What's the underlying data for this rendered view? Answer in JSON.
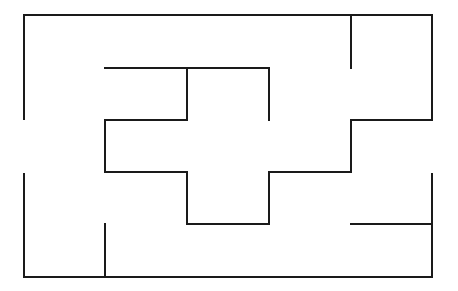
{
  "diagram": {
    "type": "maze",
    "width": 458,
    "height": 291,
    "stroke_color": "#1a1a1a",
    "stroke_width": 2,
    "segments": [
      {
        "name": "outer-top-wall",
        "x1": 24,
        "y1": 15,
        "x2": 432,
        "y2": 15
      },
      {
        "name": "outer-left-wall-upper",
        "x1": 24,
        "y1": 15,
        "x2": 24,
        "y2": 119
      },
      {
        "name": "outer-left-wall-lower",
        "x1": 24,
        "y1": 174,
        "x2": 24,
        "y2": 277
      },
      {
        "name": "outer-bottom-wall",
        "x1": 24,
        "y1": 277,
        "x2": 432,
        "y2": 277
      },
      {
        "name": "outer-right-wall-upper",
        "x1": 432,
        "y1": 15,
        "x2": 432,
        "y2": 120
      },
      {
        "name": "outer-right-wall-lower",
        "x1": 432,
        "y1": 174,
        "x2": 432,
        "y2": 277
      },
      {
        "name": "top-right-spur",
        "x1": 351,
        "y1": 15,
        "x2": 351,
        "y2": 68
      },
      {
        "name": "inner-top-horizontal",
        "x1": 105,
        "y1": 68,
        "x2": 269,
        "y2": 68
      },
      {
        "name": "inner-mid-vertical-left",
        "x1": 187,
        "y1": 68,
        "x2": 187,
        "y2": 120
      },
      {
        "name": "inner-right-vertical",
        "x1": 269,
        "y1": 68,
        "x2": 269,
        "y2": 120
      },
      {
        "name": "left-step-horizontal",
        "x1": 105,
        "y1": 120,
        "x2": 187,
        "y2": 120
      },
      {
        "name": "left-step-vertical",
        "x1": 105,
        "y1": 120,
        "x2": 105,
        "y2": 172
      },
      {
        "name": "left-lower-horizontal",
        "x1": 105,
        "y1": 172,
        "x2": 187,
        "y2": 172
      },
      {
        "name": "center-lower-vertical-left",
        "x1": 187,
        "y1": 172,
        "x2": 187,
        "y2": 224
      },
      {
        "name": "center-bottom-horizontal",
        "x1": 187,
        "y1": 224,
        "x2": 269,
        "y2": 224
      },
      {
        "name": "center-lower-vertical-right",
        "x1": 269,
        "y1": 172,
        "x2": 269,
        "y2": 224
      },
      {
        "name": "right-lower-horizontal",
        "x1": 269,
        "y1": 172,
        "x2": 351,
        "y2": 172
      },
      {
        "name": "right-step-vertical",
        "x1": 351,
        "y1": 120,
        "x2": 351,
        "y2": 172
      },
      {
        "name": "right-step-horizontal",
        "x1": 351,
        "y1": 120,
        "x2": 432,
        "y2": 120
      },
      {
        "name": "bottom-right-spur",
        "x1": 351,
        "y1": 224,
        "x2": 432,
        "y2": 224
      },
      {
        "name": "bottom-left-spur",
        "x1": 105,
        "y1": 224,
        "x2": 105,
        "y2": 277
      }
    ],
    "openings": [
      {
        "name": "left-entrance",
        "side": "left",
        "y_range": [
          119,
          174
        ]
      },
      {
        "name": "right-exit",
        "side": "right",
        "y_range": [
          120,
          174
        ]
      }
    ]
  }
}
